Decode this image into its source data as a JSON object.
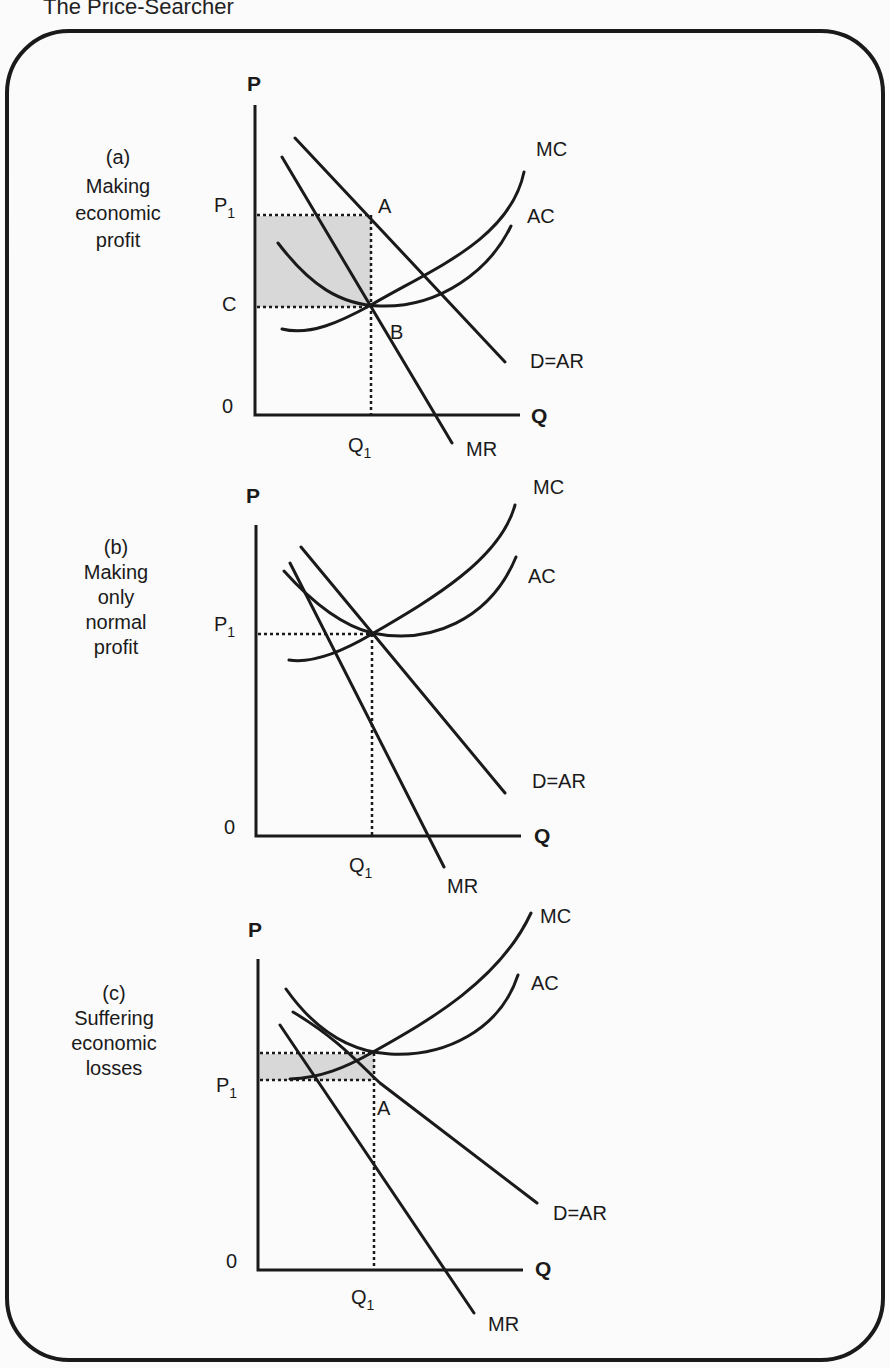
{
  "title": "The Price-Searcher",
  "panels": [
    {
      "id": "a",
      "caption": [
        "(a)",
        "Making",
        "economic",
        "profit"
      ],
      "y_axis_label": "P",
      "x_axis_label": "Q",
      "origin_label": "0",
      "price_label": "P",
      "price_sub": "1",
      "cost_label": "C",
      "quantity_label": "Q",
      "quantity_sub": "1",
      "point_labels": [
        "A",
        "B"
      ],
      "curves": {
        "mc": "MC",
        "ac": "AC",
        "demand": "D=AR",
        "mr": "MR"
      },
      "shaded_area": "economic profit"
    },
    {
      "id": "b",
      "caption": [
        "(b)",
        "Making",
        "only",
        "normal",
        "profit"
      ],
      "y_axis_label": "P",
      "x_axis_label": "Q",
      "origin_label": "0",
      "price_label": "P",
      "price_sub": "1",
      "quantity_label": "Q",
      "quantity_sub": "1",
      "curves": {
        "mc": "MC",
        "ac": "AC",
        "demand": "D=AR",
        "mr": "MR"
      }
    },
    {
      "id": "c",
      "caption": [
        "(c)",
        "Suffering",
        "economic",
        "losses"
      ],
      "y_axis_label": "P",
      "x_axis_label": "Q",
      "origin_label": "0",
      "price_label": "P",
      "price_sub": "1",
      "quantity_label": "Q",
      "quantity_sub": "1",
      "point_labels": [
        "A"
      ],
      "curves": {
        "mc": "MC",
        "ac": "AC",
        "demand": "D=AR",
        "mr": "MR"
      },
      "shaded_area": "economic loss"
    }
  ],
  "colors": {
    "ink": "#1a1a1a",
    "shade": "#d8d8d8",
    "background": "#fbfbfb"
  }
}
